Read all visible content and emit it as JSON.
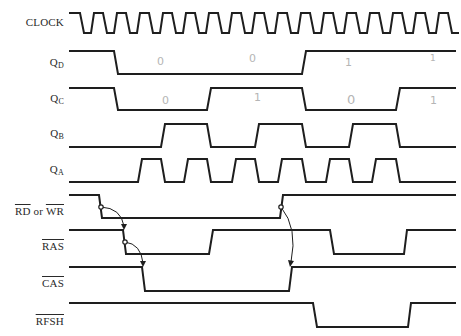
{
  "diagram": {
    "type": "timing-diagram",
    "signals": [
      {
        "id": "clock",
        "label": "CLOCK",
        "sub": "",
        "overline": false,
        "y_high": 13,
        "y_low": 33,
        "points": "69,13 80,13 84,33 91,33 94,13 103,13 107,33 114,33 117,13 126,13 130,33 137,33 140,13 149,13 153,33 160,33 163,13 172,13 176,33 183,33 186,13 195,13 199,33 206,33 209,13 218,13 222,33 229,33 232,13 241,13 245,33 252,33 255,13 264,13 268,33 275,33 278,13 287,13 291,33 298,33 301,13 310,13 314,33 321,33 324,13 333,13 337,33 344,33 347,13 356,13 360,33 367,33 370,13 379,13 383,33 390,33 393,13 402,13 406,33 413,33 416,13 425,13 429,33 436,33 439,13 448,13 452,33 459,33"
      },
      {
        "id": "qd",
        "label": "Q",
        "sub": "D",
        "overline": false,
        "points": "69,51 114,51 118,74 302,74 306,51 456,51"
      },
      {
        "id": "qc",
        "label": "Q",
        "sub": "C",
        "overline": false,
        "points": "69,88 114,88 118,110 207,110 211,88 302,88 306,110 396,110 400,88 456,88"
      },
      {
        "id": "qb",
        "label": "Q",
        "sub": "B",
        "overline": false,
        "points": "69,147 161,147 165,124 207,124 211,147 255,147 259,124 302,124 306,147 349,147 353,124 396,124 400,147 456,147"
      },
      {
        "id": "qa",
        "label": "Q",
        "sub": "A",
        "overline": false,
        "points": "69,182 138,182 142,159 161,159 165,182 184,182 188,159 207,159 211,182 232,182 236,159 255,159 259,182 278,182 282,159 302,159 306,182 326,182 330,159 349,159 353,182 372,182 376,159 396,159 400,182 456,182"
      },
      {
        "id": "rdwr",
        "label": "RD or WR",
        "sub": "",
        "overline": true,
        "points": "69,195 99,195 102,218 280,218 283,195 456,195"
      },
      {
        "id": "ras",
        "label": "RAS",
        "sub": "",
        "overline": true,
        "points": "69,230 123,230 126,254 209,254 213,230 330,230 334,254 404,254 407,230 456,230"
      },
      {
        "id": "cas",
        "label": "CAS",
        "sub": "",
        "overline": true,
        "points": "69,267 142,267 145,291 289,291 292,267 456,267"
      },
      {
        "id": "rfsh",
        "label": "RFSH",
        "sub": "",
        "overline": true,
        "points": "69,303 313,303 317,327 408,327 411,303 456,303"
      }
    ],
    "labels": {
      "clock": "CLOCK",
      "qd_main": "Q",
      "qd_sub": "D",
      "qc_main": "Q",
      "qc_sub": "C",
      "qb_main": "Q",
      "qb_sub": "B",
      "qa_main": "Q",
      "qa_sub": "A",
      "rd": "RD",
      "or": " or ",
      "wr": "WR",
      "ras": "RAS",
      "cas": "CAS",
      "rfsh": "RFSH"
    },
    "annotations": {
      "qd": [
        "0",
        "0",
        "1",
        "1"
      ],
      "qc": [
        "0",
        "1",
        "0",
        "1"
      ]
    },
    "causality_arrows": [
      {
        "from": "RD or WR falling edge",
        "to": "RAS falling edge"
      },
      {
        "from": "RAS falling edge",
        "to": "CAS falling edge"
      },
      {
        "from": "RD or WR rising edge",
        "to": "CAS rising edge"
      }
    ],
    "colors": {
      "line": "#1e1e1e",
      "label": "#2a2a2a",
      "annotation": "#b5b5b5",
      "background": "#ffffff"
    }
  }
}
